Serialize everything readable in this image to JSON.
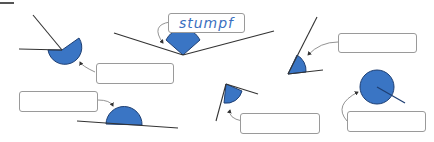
{
  "exercise": {
    "type": "angle-classification",
    "colors": {
      "angle_fill": "#3a75c4",
      "angle_stroke": "#1e3f73",
      "line": "#333333",
      "box_border": "#9a9a9a",
      "label_text": "#3a6fc0"
    },
    "angles": [
      {
        "id": "reflex-1",
        "kind": "reflex",
        "answer": ""
      },
      {
        "id": "obtuse-example",
        "kind": "obtuse",
        "answer": "stumpf"
      },
      {
        "id": "acute-1",
        "kind": "acute",
        "answer": ""
      },
      {
        "id": "straight-1",
        "kind": "straight",
        "answer": ""
      },
      {
        "id": "right-or-acute-1",
        "kind": "acute",
        "answer": ""
      },
      {
        "id": "full-1",
        "kind": "full",
        "answer": ""
      }
    ]
  }
}
